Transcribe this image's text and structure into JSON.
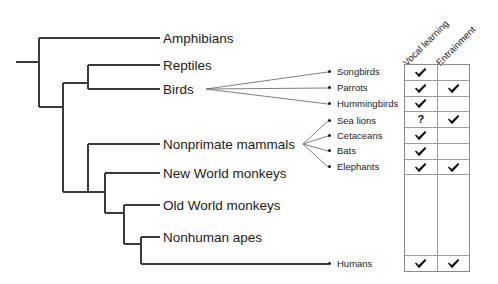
{
  "figure": {
    "type": "phylogenetic-tree-with-trait-matrix",
    "background_color": "#ffffff",
    "line_color": "#3a3a3a"
  },
  "tree": {
    "clades": [
      {
        "id": "amphibians",
        "label": "Amphibians",
        "x": 163,
        "y": 42
      },
      {
        "id": "reptiles",
        "label": "Reptiles",
        "x": 163,
        "y": 69
      },
      {
        "id": "birds",
        "label": "Birds",
        "x": 163,
        "y": 93
      },
      {
        "id": "nonprimate-mammals",
        "label": "Nonprimate mammals",
        "x": 163,
        "y": 148
      },
      {
        "id": "new-world-monkeys",
        "label": "New World monkeys",
        "x": 163,
        "y": 177
      },
      {
        "id": "old-world-monkeys",
        "label": "Old World monkeys",
        "x": 163,
        "y": 209
      },
      {
        "id": "nonhuman-apes",
        "label": "Nonhuman apes",
        "x": 163,
        "y": 241
      }
    ]
  },
  "tips": [
    {
      "id": "songbirds",
      "label": "Songbirds",
      "dot_x": 330,
      "dot_y": 72,
      "text_x": 338,
      "text_y": 68
    },
    {
      "id": "parrots",
      "label": "Parrots",
      "dot_x": 330,
      "dot_y": 88,
      "text_x": 338,
      "text_y": 84
    },
    {
      "id": "hummingbirds",
      "label": "Hummingbirds",
      "dot_x": 330,
      "dot_y": 104,
      "text_x": 338,
      "text_y": 100
    },
    {
      "id": "sea-lions",
      "label": "Sea lions",
      "dot_x": 330,
      "dot_y": 121,
      "text_x": 338,
      "text_y": 117
    },
    {
      "id": "cetaceans",
      "label": "Cetaceans",
      "dot_x": 330,
      "dot_y": 136,
      "text_x": 338,
      "text_y": 132
    },
    {
      "id": "bats",
      "label": "Bats",
      "dot_x": 330,
      "dot_y": 151,
      "text_x": 338,
      "text_y": 147
    },
    {
      "id": "elephants",
      "label": "Elephants",
      "dot_x": 330,
      "dot_y": 167,
      "text_x": 338,
      "text_y": 163
    },
    {
      "id": "humans",
      "label": "Humans",
      "dot_x": 330,
      "dot_y": 264,
      "text_x": 338,
      "text_y": 260
    }
  ],
  "matrix": {
    "columns": [
      {
        "id": "vocal-learning",
        "label": "Vocal  learning"
      },
      {
        "id": "entrainment",
        "label": "Entrainment"
      }
    ],
    "rows": [
      {
        "taxon": "Songbirds",
        "vocal_learning": "check",
        "entrainment": ""
      },
      {
        "taxon": "Parrots",
        "vocal_learning": "check",
        "entrainment": "check"
      },
      {
        "taxon": "Hummingbirds",
        "vocal_learning": "check",
        "entrainment": ""
      },
      {
        "taxon": "Sea lions",
        "vocal_learning": "question",
        "entrainment": "check"
      },
      {
        "taxon": "Cetaceans",
        "vocal_learning": "check",
        "entrainment": ""
      },
      {
        "taxon": "Bats",
        "vocal_learning": "check",
        "entrainment": ""
      },
      {
        "taxon": "Elephants",
        "vocal_learning": "check",
        "entrainment": "check"
      },
      {
        "taxon": "",
        "vocal_learning": "",
        "entrainment": ""
      },
      {
        "taxon": "Humans",
        "vocal_learning": "check",
        "entrainment": "check"
      }
    ],
    "question_glyph": "?"
  }
}
